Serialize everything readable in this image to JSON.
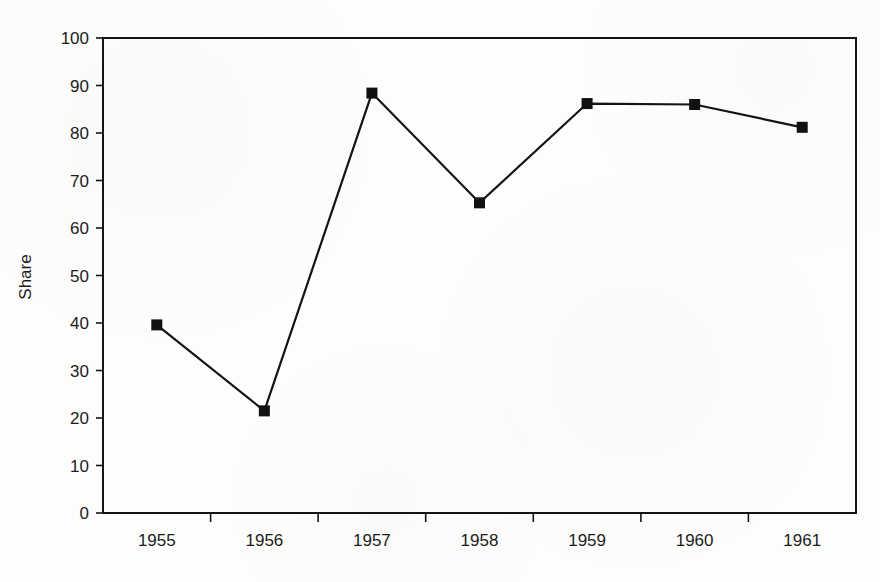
{
  "chart_data": {
    "type": "line",
    "title": "",
    "xlabel": "",
    "ylabel": "Share",
    "categories": [
      "1955",
      "1956",
      "1957",
      "1958",
      "1959",
      "1960",
      "1961"
    ],
    "values": [
      39.6,
      21.5,
      88.4,
      65.3,
      86.2,
      86.0,
      81.2
    ],
    "series": [
      {
        "name": "Share",
        "values": [
          39.6,
          21.5,
          88.4,
          65.3,
          86.2,
          86.0,
          81.2
        ]
      }
    ],
    "ylim": [
      0,
      100
    ],
    "ytick_values": [
      0,
      10,
      20,
      30,
      40,
      50,
      60,
      70,
      80,
      90,
      100
    ],
    "ytick_labels": [
      "0",
      "10",
      "20",
      "30",
      "40",
      "50",
      "60",
      "70",
      "80",
      "90",
      "100"
    ],
    "grid": false,
    "legend": false,
    "legend_position": "none",
    "marker": "filled-square",
    "line_color": "#111111",
    "marker_color": "#111111",
    "axis_color": "#111111",
    "background_color": "#fdfdfc"
  },
  "axes": {
    "y_axis_title": "Share",
    "x_axis_title": ""
  }
}
